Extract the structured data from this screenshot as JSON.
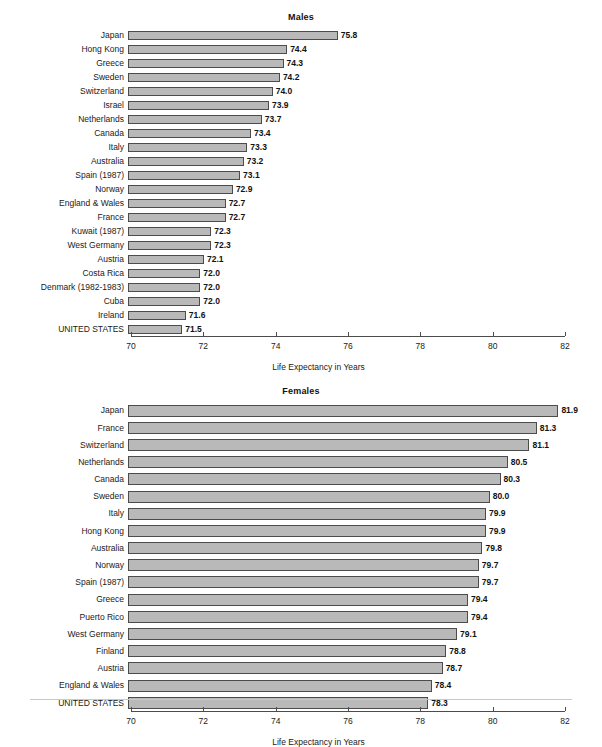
{
  "axis": {
    "title": "Life Expectancy in Years",
    "ticks": [
      "70",
      "72",
      "74",
      "76",
      "78",
      "80",
      "82"
    ]
  },
  "charts": [
    {
      "title": "Males",
      "id": "males"
    },
    {
      "title": "Females",
      "id": "females"
    }
  ],
  "chart_data": [
    {
      "type": "bar",
      "orientation": "horizontal",
      "title": "Males",
      "xlabel": "Life Expectancy in Years",
      "ylabel": "",
      "xlim": [
        70,
        82
      ],
      "xticks": [
        70,
        72,
        74,
        76,
        78,
        80,
        82
      ],
      "grid": false,
      "legend": "none",
      "categories": [
        "Japan",
        "Hong Kong",
        "Greece",
        "Sweden",
        "Switzerland",
        "Israel",
        "Netherlands",
        "Canada",
        "Italy",
        "Australia",
        "Spain (1987)",
        "Norway",
        "England & Wales",
        "France",
        "Kuwait (1987)",
        "West Germany",
        "Austria",
        "Costa Rica",
        "Denmark (1982-1983)",
        "Cuba",
        "Ireland",
        "UNITED STATES"
      ],
      "values": [
        75.8,
        74.4,
        74.3,
        74.2,
        74.0,
        73.9,
        73.7,
        73.4,
        73.3,
        73.2,
        73.1,
        72.9,
        72.7,
        72.7,
        72.3,
        72.3,
        72.1,
        72.0,
        72.0,
        72.0,
        71.6,
        71.5
      ],
      "value_labels": [
        "75.8",
        "74.4",
        "74.3",
        "74.2",
        "74.0",
        "73.9",
        "73.7",
        "73.4",
        "73.3",
        "73.2",
        "73.1",
        "72.9",
        "72.7",
        "72.7",
        "72.3",
        "72.3",
        "72.1",
        "72.0",
        "72.0",
        "72.0",
        "71.6",
        "71.5"
      ]
    },
    {
      "type": "bar",
      "orientation": "horizontal",
      "title": "Females",
      "xlabel": "Life Expectancy in Years",
      "ylabel": "",
      "xlim": [
        70,
        82
      ],
      "xticks": [
        70,
        72,
        74,
        76,
        78,
        80,
        82
      ],
      "grid": false,
      "legend": "none",
      "categories": [
        "Japan",
        "France",
        "Switzerland",
        "Netherlands",
        "Canada",
        "Sweden",
        "Italy",
        "Hong Kong",
        "Australia",
        "Norway",
        "Spain (1987)",
        "Greece",
        "Puerto Rico",
        "West Germany",
        "Finland",
        "Austria",
        "England & Wales",
        "UNITED STATES"
      ],
      "values": [
        81.9,
        81.3,
        81.1,
        80.5,
        80.3,
        80.0,
        79.9,
        79.9,
        79.8,
        79.7,
        79.7,
        79.4,
        79.4,
        79.1,
        78.8,
        78.7,
        78.4,
        78.3
      ],
      "value_labels": [
        "81.9",
        "81.3",
        "81.1",
        "80.5",
        "80.3",
        "80.0",
        "79.9",
        "79.9",
        "79.8",
        "79.7",
        "79.7",
        "79.4",
        "79.4",
        "79.1",
        "78.8",
        "78.7",
        "78.4",
        "78.3"
      ]
    }
  ],
  "colors": {
    "bar_fill": "#b9b9b9",
    "bar_border": "#4c4c4c",
    "text": "#1a1a1a"
  }
}
